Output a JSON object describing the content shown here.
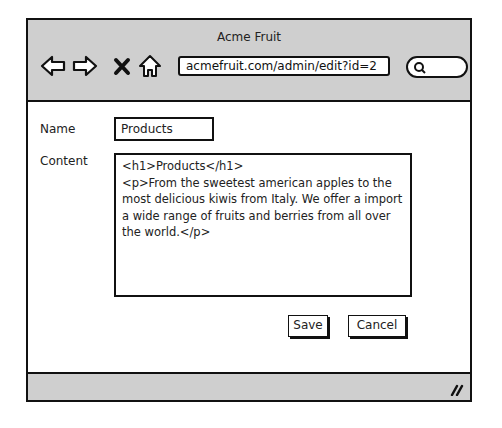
{
  "window": {
    "title": "Acme Fruit",
    "url": "acmefruit.com/admin/edit?id=2",
    "nav_icons": [
      "back-arrow-icon",
      "forward-arrow-icon",
      "close-x-icon",
      "home-icon"
    ],
    "search_icon": "search-icon"
  },
  "form": {
    "name_label": "Name",
    "name_value": "Products",
    "content_label": "Content",
    "content_value": "<h1>Products</h1>\n<p>From the sweetest american apples to the most delicious kiwis from Italy. We offer a import a wide range of fruits and berries from all over the world.</p>",
    "save_label": "Save",
    "cancel_label": "Cancel"
  },
  "colors": {
    "chrome": "#cfcfcf",
    "border": "#111111",
    "background": "#ffffff"
  }
}
